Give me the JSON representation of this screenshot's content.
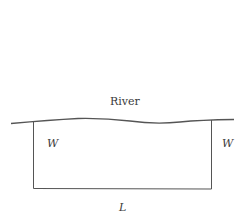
{
  "diagram": {
    "type": "fenced-rectangle-along-river",
    "labels": {
      "river": "River",
      "side_left": "W",
      "side_right": "W",
      "bottom": "L"
    },
    "colors": {
      "stroke": "#555555",
      "text": "#3a3a3a",
      "background": "#ffffff"
    }
  }
}
